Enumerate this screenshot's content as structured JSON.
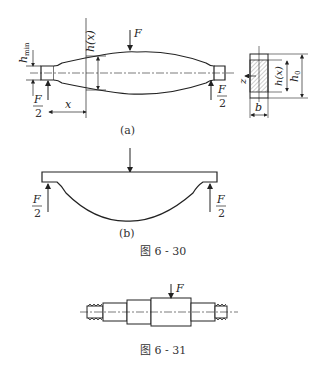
{
  "figure_6_30": {
    "caption": "图 6 - 30",
    "part_a": {
      "label": "(a)",
      "force": "F",
      "h_min": "h",
      "h_min_sub": "min",
      "h_x": "h(x)",
      "x": "x",
      "half_force_num": "F",
      "half_force_den": "2",
      "section": {
        "h_x": "h(x)",
        "h0": "h",
        "h0_sub": "0",
        "b": "b",
        "z": "z"
      }
    },
    "part_b": {
      "label": "(b)",
      "half_force_num": "F",
      "half_force_den": "2"
    }
  },
  "figure_6_31": {
    "caption": "图 6 - 31",
    "force": "F"
  }
}
